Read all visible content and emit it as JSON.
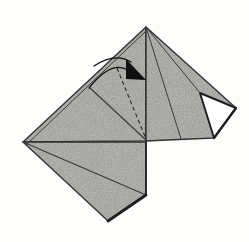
{
  "canvas": {
    "width": 249,
    "height": 242,
    "background": "#fdfdfc"
  },
  "palette": {
    "paper": "#d7d6d3",
    "paper_grain": "#6f6e68",
    "edge": "#3b3b3b",
    "heavy_edge": "#1f1f1f",
    "arrow": "#101010",
    "white_face": "#ffffff",
    "dashed": "#2f2f2f"
  },
  "diagram": {
    "polygons": [
      {
        "name": "upper-left-face",
        "points": "23,142 146,27 146,141",
        "fill": "paper",
        "stroke": "edge",
        "width": 1.4
      },
      {
        "name": "upper-right-face",
        "points": "146,27 236,108 214,138 146,141",
        "fill": "paper",
        "stroke": "edge",
        "width": 1.4
      },
      {
        "name": "lower-face",
        "points": "23,142 146,142 146,195 108,221",
        "fill": "paper",
        "stroke": "edge",
        "width": 1.4
      },
      {
        "name": "reverse-fold-white-face",
        "points": "200,93 236,108 214,138",
        "fill": "white_face",
        "stroke": "heavy_edge",
        "width": 1.9
      }
    ],
    "crease_lines": [
      {
        "name": "crease-apex-to-base",
        "x1": 146,
        "y1": 27,
        "x2": 181,
        "y2": 139,
        "width": 1.0
      },
      {
        "name": "crease-apex-to-white-tip",
        "x1": 146,
        "y1": 27,
        "x2": 200,
        "y2": 93,
        "width": 1.0
      },
      {
        "name": "crease-left-flap",
        "x1": 90,
        "y1": 88,
        "x2": 146,
        "y2": 140,
        "width": 1.2
      },
      {
        "name": "crease-lower-diagonal",
        "x1": 23,
        "y1": 142,
        "x2": 146,
        "y2": 195,
        "width": 1.2
      },
      {
        "name": "layered-edge-double-line",
        "x1": 26,
        "y1": 145,
        "x2": 146,
        "y2": 31,
        "width": 1.0
      }
    ],
    "heavy_edges": [
      {
        "name": "bottom-shadow-edge",
        "x1": 146,
        "y1": 195,
        "x2": 108,
        "y2": 221,
        "width": 2.8
      },
      {
        "name": "white-flap-outer-edge",
        "x1": 236,
        "y1": 108,
        "x2": 214,
        "y2": 138,
        "width": 2.2
      },
      {
        "name": "center-vertical-edge",
        "x1": 146,
        "y1": 142,
        "x2": 146,
        "y2": 195,
        "width": 1.6
      }
    ],
    "fold_line": {
      "name": "valley-fold-dashed-line",
      "x1": 117,
      "y1": 68,
      "x2": 146,
      "y2": 139,
      "dash": "4 3",
      "width": 1.2
    },
    "fold_arrow": {
      "arcs": [
        "M 94 66 Q 115 52 131 62",
        "M 89 88 Q 111 60 128 70"
      ],
      "arc_width": 1.3,
      "head_points": "126,59 146,80 126,79"
    }
  }
}
